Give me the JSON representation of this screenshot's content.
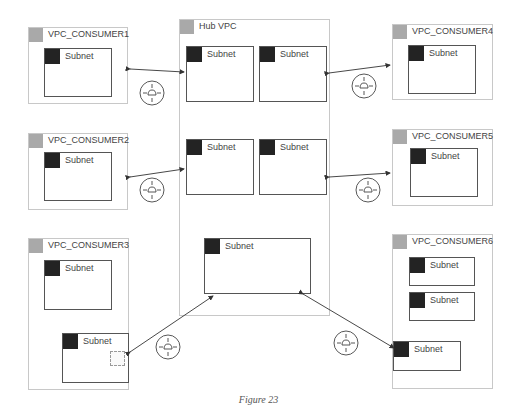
{
  "diagram": {
    "caption": "Figure 23",
    "hub": {
      "label": "Hub VPC",
      "subnets": [
        {
          "label": "Subnet"
        },
        {
          "label": "Subnet"
        },
        {
          "label": "Subnet"
        },
        {
          "label": "Subnet"
        },
        {
          "label": "Subnet"
        }
      ]
    },
    "consumers": [
      {
        "label": "VPC_CONSUMER1",
        "subnets": [
          {
            "label": "Subnet"
          }
        ]
      },
      {
        "label": "VPC_CONSUMER2",
        "subnets": [
          {
            "label": "Subnet"
          }
        ]
      },
      {
        "label": "VPC_CONSUMER3",
        "subnets": [
          {
            "label": "Subnet"
          },
          {
            "label": "Subnet"
          }
        ]
      },
      {
        "label": "VPC_CONSUMER4",
        "subnets": [
          {
            "label": "Subnet"
          }
        ]
      },
      {
        "label": "VPC_CONSUMER5",
        "subnets": [
          {
            "label": "Subnet"
          }
        ]
      },
      {
        "label": "VPC_CONSUMER6",
        "subnets": [
          {
            "label": "Subnet"
          },
          {
            "label": "Subnet"
          },
          {
            "label": "Subnet"
          }
        ]
      }
    ],
    "icons": {
      "vpc": "vpc-cloud-icon",
      "subnet": "subnet-cloud-lock-icon",
      "router": "router-icon",
      "endpoint": "chip-icon"
    },
    "colors": {
      "vpc_border": "#c8c8c8",
      "vpc_icon_bg": "#a9a9a9",
      "subnet_border": "#555555",
      "subnet_icon_bg": "#232323",
      "connector": "#333333"
    }
  }
}
